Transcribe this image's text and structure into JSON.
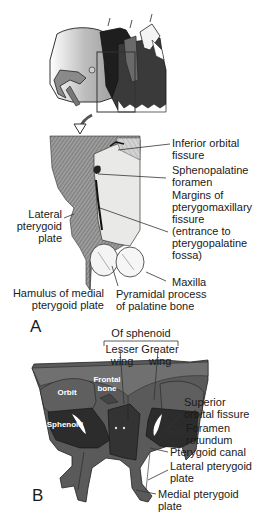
{
  "figure": {
    "panel_a": {
      "letter": "A",
      "labels": {
        "inferior_orbital_fissure": [
          "Inferior orbital",
          "fissure"
        ],
        "sphenopalatine_foramen": [
          "Sphenopalatine",
          "foramen"
        ],
        "margins_pterygomaxillary": [
          "Margins of",
          "pterygomaxillary",
          "fissure",
          "(entrance to",
          "pterygopalatine",
          "fossa)"
        ],
        "maxilla": [
          "Maxilla"
        ],
        "lateral_pterygoid_plate": [
          "Lateral",
          "pterygoid",
          "plate"
        ],
        "hamulus": [
          "Hamulus of medial",
          "pterygoid plate"
        ],
        "pyramidal_process": [
          "Pyramidal process",
          "of palatine bone"
        ]
      }
    },
    "panel_b": {
      "letter": "B",
      "group_heading": "Of sphenoid",
      "labels": {
        "lesser_wing": [
          "Lesser",
          "wing"
        ],
        "greater_wing": [
          "Greater",
          "wing"
        ],
        "superior_orbital_fissure": [
          "Superior",
          "orbital fissure"
        ],
        "foramen_rotundum": [
          "Foramen",
          "rotundum"
        ],
        "pterygoid_canal": [
          "Pterygoid canal"
        ],
        "lateral_pterygoid_plate": [
          "Lateral pterygoid",
          "plate"
        ],
        "medial_pterygoid_plate": [
          "Medial pterygoid",
          "plate"
        ]
      },
      "inner_labels": {
        "orbit": "Orbit",
        "frontal_bone": [
          "Frontal",
          "bone"
        ],
        "sphenoid": "Sphenoid"
      }
    }
  }
}
